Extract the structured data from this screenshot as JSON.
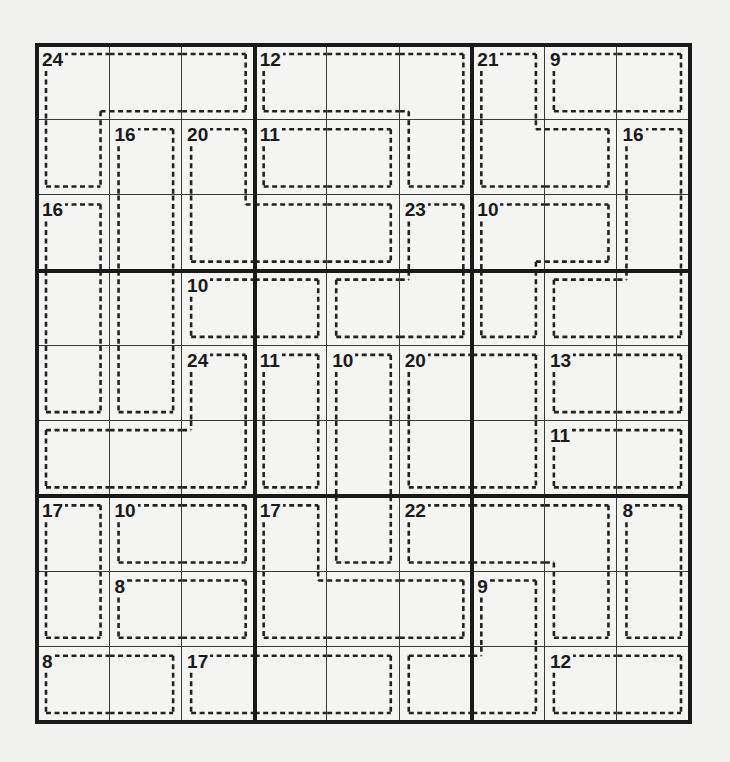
{
  "puzzle": {
    "type": "Killer Sudoku",
    "size": 9,
    "box": 3,
    "colors": {
      "grid_line": "#3a3a3a",
      "box_line": "#1a1a1a",
      "cage_line": "#222222",
      "background": "#f4f4f2"
    },
    "cages": [
      {
        "sum": "24",
        "cells": [
          [
            0,
            0
          ],
          [
            0,
            1
          ],
          [
            0,
            2
          ],
          [
            1,
            0
          ]
        ]
      },
      {
        "sum": "12",
        "cells": [
          [
            0,
            3
          ],
          [
            0,
            4
          ],
          [
            0,
            5
          ],
          [
            1,
            5
          ]
        ]
      },
      {
        "sum": "21",
        "cells": [
          [
            0,
            6
          ],
          [
            1,
            6
          ],
          [
            1,
            7
          ]
        ]
      },
      {
        "sum": "9",
        "cells": [
          [
            0,
            7
          ],
          [
            0,
            8
          ]
        ]
      },
      {
        "sum": "16",
        "cells": [
          [
            1,
            1
          ],
          [
            2,
            1
          ],
          [
            3,
            1
          ],
          [
            4,
            1
          ]
        ]
      },
      {
        "sum": "20",
        "cells": [
          [
            1,
            2
          ],
          [
            2,
            2
          ],
          [
            2,
            3
          ],
          [
            2,
            4
          ]
        ]
      },
      {
        "sum": "11",
        "cells": [
          [
            1,
            3
          ],
          [
            1,
            4
          ]
        ]
      },
      {
        "sum": "16",
        "cells": [
          [
            1,
            8
          ],
          [
            2,
            8
          ],
          [
            3,
            8
          ],
          [
            3,
            7
          ]
        ]
      },
      {
        "sum": "16",
        "cells": [
          [
            2,
            0
          ],
          [
            3,
            0
          ],
          [
            4,
            0
          ]
        ]
      },
      {
        "sum": "23",
        "cells": [
          [
            2,
            5
          ],
          [
            3,
            4
          ],
          [
            3,
            5
          ]
        ]
      },
      {
        "sum": "10",
        "cells": [
          [
            2,
            6
          ],
          [
            2,
            7
          ],
          [
            3,
            6
          ]
        ]
      },
      {
        "sum": "10",
        "cells": [
          [
            3,
            2
          ],
          [
            3,
            3
          ]
        ]
      },
      {
        "sum": "24",
        "cells": [
          [
            4,
            2
          ],
          [
            5,
            0
          ],
          [
            5,
            1
          ],
          [
            5,
            2
          ]
        ]
      },
      {
        "sum": "11",
        "cells": [
          [
            4,
            3
          ],
          [
            5,
            3
          ]
        ]
      },
      {
        "sum": "10",
        "cells": [
          [
            4,
            4
          ],
          [
            5,
            4
          ],
          [
            6,
            4
          ]
        ]
      },
      {
        "sum": "20",
        "cells": [
          [
            4,
            5
          ],
          [
            4,
            6
          ],
          [
            5,
            5
          ],
          [
            5,
            6
          ]
        ]
      },
      {
        "sum": "13",
        "cells": [
          [
            4,
            7
          ],
          [
            4,
            8
          ]
        ]
      },
      {
        "sum": "11",
        "cells": [
          [
            5,
            7
          ],
          [
            5,
            8
          ]
        ]
      },
      {
        "sum": "17",
        "cells": [
          [
            6,
            0
          ],
          [
            7,
            0
          ]
        ]
      },
      {
        "sum": "10",
        "cells": [
          [
            6,
            1
          ],
          [
            6,
            2
          ]
        ]
      },
      {
        "sum": "17",
        "cells": [
          [
            6,
            3
          ],
          [
            7,
            3
          ],
          [
            7,
            4
          ],
          [
            7,
            5
          ]
        ]
      },
      {
        "sum": "22",
        "cells": [
          [
            6,
            5
          ],
          [
            6,
            6
          ],
          [
            6,
            7
          ],
          [
            7,
            7
          ]
        ]
      },
      {
        "sum": "8",
        "cells": [
          [
            6,
            8
          ],
          [
            7,
            8
          ]
        ]
      },
      {
        "sum": "8",
        "cells": [
          [
            7,
            1
          ],
          [
            7,
            2
          ]
        ]
      },
      {
        "sum": "9",
        "cells": [
          [
            7,
            6
          ],
          [
            8,
            6
          ],
          [
            8,
            5
          ]
        ]
      },
      {
        "sum": "8",
        "cells": [
          [
            8,
            0
          ],
          [
            8,
            1
          ]
        ]
      },
      {
        "sum": "17",
        "cells": [
          [
            8,
            2
          ],
          [
            8,
            3
          ],
          [
            8,
            4
          ]
        ]
      },
      {
        "sum": "12",
        "cells": [
          [
            8,
            7
          ],
          [
            8,
            8
          ]
        ]
      }
    ],
    "values": [
      [
        "",
        "",
        "",
        "",
        "",
        "",
        "",
        "",
        ""
      ],
      [
        "",
        "",
        "",
        "",
        "",
        "",
        "",
        "",
        ""
      ],
      [
        "",
        "",
        "",
        "",
        "",
        "",
        "",
        "",
        ""
      ],
      [
        "",
        "",
        "",
        "",
        "",
        "",
        "",
        "",
        ""
      ],
      [
        "",
        "",
        "",
        "",
        "",
        "",
        "",
        "",
        ""
      ],
      [
        "",
        "",
        "",
        "",
        "",
        "",
        "",
        "",
        ""
      ],
      [
        "",
        "",
        "",
        "",
        "",
        "",
        "",
        "",
        ""
      ],
      [
        "",
        "",
        "",
        "",
        "",
        "",
        "",
        "",
        ""
      ],
      [
        "",
        "",
        "",
        "",
        "",
        "",
        "",
        "",
        ""
      ]
    ]
  }
}
